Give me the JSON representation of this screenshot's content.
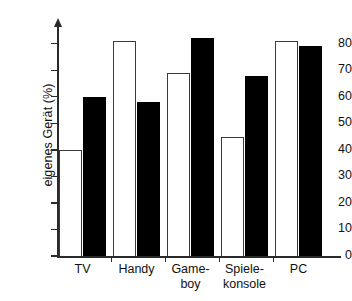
{
  "chart_data": {
    "type": "bar",
    "title": "",
    "subtitle": "",
    "xlabel": "",
    "ylabel": "eigenes Gerät (%)",
    "ylim": [
      0,
      85
    ],
    "yticks": [
      0,
      10,
      20,
      30,
      40,
      50,
      60,
      70,
      80
    ],
    "ytick_labels": [
      "0",
      "10",
      "20",
      "30",
      "40",
      "50",
      "60",
      "70",
      "80"
    ],
    "grid": false,
    "legend": "none",
    "categories": [
      "TV",
      "Handy",
      "Game-\nboy",
      "Spiele-\nkonsole",
      "PC"
    ],
    "series": [
      {
        "name": "white-bars",
        "fill": "#ffffff",
        "edge": "#3a3a3a",
        "values": [
          40,
          81,
          69,
          45,
          81
        ]
      },
      {
        "name": "black-bars",
        "fill": "#000000",
        "edge": "#000000",
        "values": [
          60,
          58,
          82,
          68,
          79
        ]
      }
    ]
  },
  "axes": {
    "y_label_text": "eigenes Gerät (%)",
    "y_axis_has_arrow": true,
    "x_axis_color": "#2a2a2a",
    "y_axis_color": "#2a2a2a"
  },
  "colors": {
    "background": "#ffffff",
    "ink": "#111111",
    "series_white": "#ffffff",
    "series_black": "#000000",
    "axis": "#2a2a2a"
  }
}
